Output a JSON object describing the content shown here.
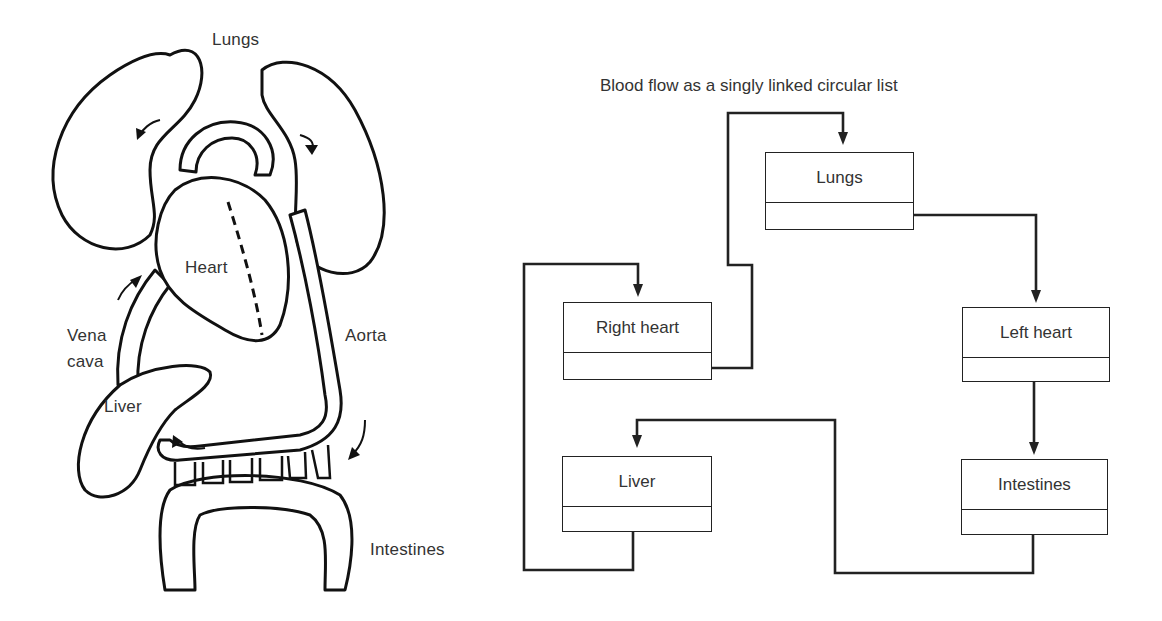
{
  "anatomy": {
    "labels": {
      "lungs": "Lungs",
      "heart": "Heart",
      "vena_cava_line1": "Vena",
      "vena_cava_line2": "cava",
      "aorta": "Aorta",
      "liver": "Liver",
      "intestines": "Intestines"
    }
  },
  "linked_list": {
    "title": "Blood flow as a singly linked circular list",
    "nodes": [
      {
        "id": "lungs",
        "label": "Lungs",
        "next": "left_heart"
      },
      {
        "id": "left_heart",
        "label": "Left heart",
        "next": "intestines"
      },
      {
        "id": "intestines",
        "label": "Intestines",
        "next": "liver"
      },
      {
        "id": "liver",
        "label": "Liver",
        "next": "right_heart"
      },
      {
        "id": "right_heart",
        "label": "Right heart",
        "next": "lungs"
      }
    ],
    "colors": {
      "line": "#222222",
      "text": "#333333",
      "background": "#ffffff"
    }
  }
}
